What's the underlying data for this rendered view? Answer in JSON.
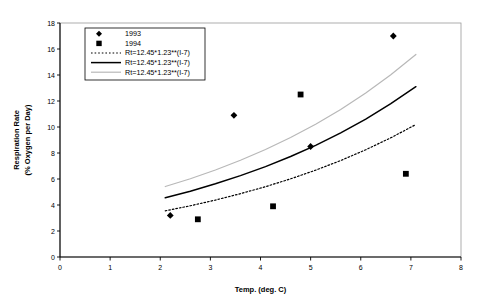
{
  "chart_data": {
    "type": "scatter",
    "title": "",
    "xlabel": "Temp. (deg. C)",
    "ylabel": "Respiration Rate\n(% Oxygen per Day)",
    "ylabel_line1": "Respiration Rate",
    "ylabel_line2": "(% Oxygen per Day)",
    "xlim": [
      0,
      8
    ],
    "ylim": [
      0,
      18
    ],
    "xticks": [
      "0",
      "1",
      "2",
      "3",
      "4",
      "5",
      "6",
      "7",
      "8"
    ],
    "xtick_values": [
      0,
      1,
      2,
      3,
      4,
      5,
      6,
      7,
      8
    ],
    "yticks": [
      "0",
      "2",
      "4",
      "6",
      "8",
      "10",
      "12",
      "14",
      "16",
      "18"
    ],
    "ytick_values": [
      0,
      2,
      4,
      6,
      8,
      10,
      12,
      14,
      16,
      18
    ],
    "grid": false,
    "legend_position": "upper-left",
    "series": [
      {
        "name": "1993",
        "marker": "diamond",
        "color": "#000000",
        "points": [
          {
            "x": 2.2,
            "y": 3.2
          },
          {
            "x": 3.47,
            "y": 10.9
          },
          {
            "x": 5.0,
            "y": 8.5
          },
          {
            "x": 6.65,
            "y": 17.0
          }
        ]
      },
      {
        "name": "1994",
        "marker": "square",
        "color": "#000000",
        "points": [
          {
            "x": 2.75,
            "y": 2.9
          },
          {
            "x": 4.25,
            "y": 3.9
          },
          {
            "x": 4.8,
            "y": 12.5
          },
          {
            "x": 6.9,
            "y": 6.4
          }
        ]
      },
      {
        "name": "Rt=12.45*1.23**(I-7)",
        "marker": "none",
        "line_style": "dotted",
        "color": "#000000",
        "x_range": [
          2.1,
          7.1
        ],
        "curve": [
          {
            "x": 2.1,
            "y": 3.55
          },
          {
            "x": 2.6,
            "y": 3.94
          },
          {
            "x": 3.1,
            "y": 4.38
          },
          {
            "x": 3.6,
            "y": 4.87
          },
          {
            "x": 4.1,
            "y": 5.41
          },
          {
            "x": 4.6,
            "y": 6.01
          },
          {
            "x": 5.1,
            "y": 6.68
          },
          {
            "x": 5.6,
            "y": 7.42
          },
          {
            "x": 6.1,
            "y": 8.25
          },
          {
            "x": 6.6,
            "y": 9.17
          },
          {
            "x": 7.1,
            "y": 10.19
          }
        ]
      },
      {
        "name": "Rt=12.45*1.23**(I-7)",
        "marker": "none",
        "line_style": "solid",
        "color": "#000000",
        "x_range": [
          2.1,
          7.1
        ],
        "curve": [
          {
            "x": 2.1,
            "y": 4.56
          },
          {
            "x": 2.6,
            "y": 5.06
          },
          {
            "x": 3.1,
            "y": 5.63
          },
          {
            "x": 3.6,
            "y": 6.26
          },
          {
            "x": 4.1,
            "y": 6.95
          },
          {
            "x": 4.6,
            "y": 7.73
          },
          {
            "x": 5.1,
            "y": 8.59
          },
          {
            "x": 5.6,
            "y": 9.55
          },
          {
            "x": 6.1,
            "y": 10.61
          },
          {
            "x": 6.6,
            "y": 11.79
          },
          {
            "x": 7.1,
            "y": 13.1
          }
        ]
      },
      {
        "name": "Rt=12.45*1.23**(I-7)",
        "marker": "none",
        "line_style": "solid-light",
        "color": "#b8b8b8",
        "x_range": [
          2.1,
          7.1
        ],
        "curve": [
          {
            "x": 2.1,
            "y": 5.42
          },
          {
            "x": 2.6,
            "y": 6.02
          },
          {
            "x": 3.1,
            "y": 6.69
          },
          {
            "x": 3.6,
            "y": 7.44
          },
          {
            "x": 4.1,
            "y": 8.27
          },
          {
            "x": 4.6,
            "y": 9.19
          },
          {
            "x": 5.1,
            "y": 10.21
          },
          {
            "x": 5.6,
            "y": 11.35
          },
          {
            "x": 6.1,
            "y": 12.62
          },
          {
            "x": 6.6,
            "y": 14.02
          },
          {
            "x": 7.1,
            "y": 15.58
          }
        ]
      }
    ],
    "legend_entries": [
      {
        "label": "1993",
        "swatch": "diamond-marker"
      },
      {
        "label": "1994",
        "swatch": "square-marker"
      },
      {
        "label": "Rt=12.45*1.23**(I-7)",
        "swatch": "dotted-line"
      },
      {
        "label": "Rt=12.45*1.23**(I-7)",
        "swatch": "solid-line"
      },
      {
        "label": "Rt=12.45*1.23**(I-7)",
        "swatch": "light-line"
      }
    ]
  }
}
